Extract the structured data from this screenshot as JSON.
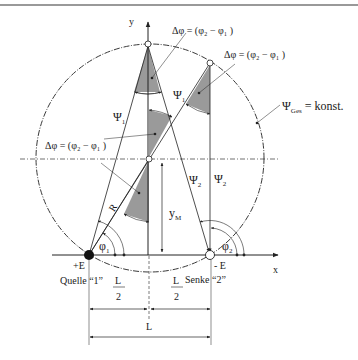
{
  "diagram": {
    "axes": {
      "x_label": "x",
      "y_label": "y"
    },
    "labels": {
      "delta_phi_top": "Δφ = (φ₂ − φ₁ )",
      "delta_phi_right": "Δφ = (φ₂ − φ₁ )",
      "delta_phi_left": "Δφ = (φ₂ − φ₁ )",
      "psi1_left": "Ψ",
      "psi1_left_sub": "1",
      "psi1_mid": "Ψ",
      "psi1_mid_sub": "1",
      "psi2_mid": "Ψ",
      "psi2_mid_sub": "2",
      "psi2_right": "Ψ",
      "psi2_right_sub": "2",
      "psi_ges": "Ψ",
      "psi_ges_sub": "Ges",
      "psi_ges_value": " = konst.",
      "radius": "R",
      "y_m": "y",
      "y_m_sub": "M",
      "phi1": "φ",
      "phi1_sub": "1",
      "phi2": "φ",
      "phi2_sub": "2",
      "source_charge": "+E",
      "source_name": "Quelle  “1”",
      "sink_charge": "- E",
      "sink_name": "Senke  “2”",
      "half_L_num": "L",
      "half_L_den": "2",
      "L": "L"
    },
    "points": {
      "source": {
        "x": 89,
        "y": 255
      },
      "sink": {
        "x": 210,
        "y": 255
      },
      "circle_center": {
        "x": 150,
        "y": 158
      },
      "circle_radius": 114
    },
    "colors": {
      "line": "#222222",
      "shade": "#9a9a9a",
      "frame": "#777777"
    }
  }
}
